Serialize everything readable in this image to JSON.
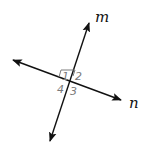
{
  "diagram": {
    "type": "intersecting-lines",
    "lines": [
      {
        "name": "m",
        "label": "m",
        "from": [
          50,
          142
        ],
        "to": [
          90,
          22
        ],
        "arrows": "both"
      },
      {
        "name": "n",
        "label": "n",
        "from": [
          12,
          60
        ],
        "to": [
          122,
          101
        ],
        "arrows": "both"
      }
    ],
    "intersection": [
      69,
      81
    ],
    "right_angle_marker": {
      "angle": "1"
    },
    "angles": [
      {
        "id": "1",
        "label": "1"
      },
      {
        "id": "2",
        "label": "2"
      },
      {
        "id": "3",
        "label": "3"
      },
      {
        "id": "4",
        "label": "4"
      }
    ],
    "colors": {
      "line": "#111111",
      "angle_label": "#7a7a7a",
      "marker": "#7a7a7a"
    }
  }
}
